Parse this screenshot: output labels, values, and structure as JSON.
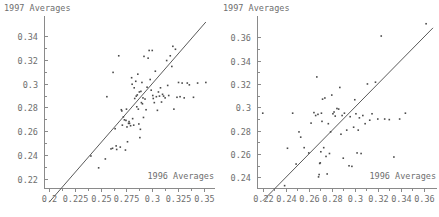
{
  "figure": {
    "panels": [
      {
        "id": "left",
        "ylabel": "1997 Averages",
        "xlabel": "1996 Averages"
      },
      {
        "id": "right",
        "ylabel": "1997 Averages",
        "xlabel": "1996 Averages"
      }
    ]
  },
  "chart_data": [
    {
      "type": "scatter",
      "title": "",
      "xlabel": "1996 Averages",
      "ylabel": "1997 Averages",
      "xlim": [
        0.195,
        0.357
      ],
      "ylim": [
        0.212,
        0.352
      ],
      "xticks": [
        0.2,
        0.225,
        0.25,
        0.275,
        0.3,
        0.325,
        0.35
      ],
      "xticklabels": [
        "0.2",
        "0.225",
        "0.25",
        "0.275",
        "0.3",
        "0.325",
        "0.35"
      ],
      "yticks": [
        0.22,
        0.24,
        0.26,
        0.28,
        0.3,
        0.32,
        0.34
      ],
      "yticklabels": [
        "0.22",
        "0.24",
        "0.26",
        "0.28",
        "0.3",
        "0.32",
        "0.34"
      ],
      "grid": false,
      "legend": null,
      "annotations": [
        {
          "kind": "reference-line",
          "label": "y = x identity line",
          "from": [
            0.2,
            0.2
          ],
          "to": [
            0.352,
            0.352
          ]
        }
      ],
      "x": [
        0.2405,
        0.248,
        0.2545,
        0.256,
        0.26,
        0.2615,
        0.262,
        0.264,
        0.265,
        0.2655,
        0.2675,
        0.269,
        0.27,
        0.2705,
        0.271,
        0.272,
        0.273,
        0.274,
        0.2745,
        0.275,
        0.2755,
        0.276,
        0.277,
        0.2775,
        0.278,
        0.279,
        0.28,
        0.2805,
        0.281,
        0.282,
        0.2825,
        0.283,
        0.284,
        0.2845,
        0.285,
        0.2855,
        0.286,
        0.2865,
        0.287,
        0.2875,
        0.288,
        0.2885,
        0.289,
        0.2895,
        0.29,
        0.2905,
        0.291,
        0.2915,
        0.292,
        0.293,
        0.294,
        0.295,
        0.296,
        0.297,
        0.298,
        0.299,
        0.3,
        0.3005,
        0.301,
        0.302,
        0.303,
        0.304,
        0.305,
        0.306,
        0.307,
        0.308,
        0.309,
        0.31,
        0.311,
        0.3125,
        0.314,
        0.315,
        0.316,
        0.3175,
        0.319,
        0.32,
        0.321,
        0.3225,
        0.324,
        0.3255,
        0.327,
        0.329,
        0.331,
        0.334,
        0.336,
        0.34,
        0.344,
        0.352
      ],
      "y": [
        0.239,
        0.229,
        0.2365,
        0.289,
        0.245,
        0.2455,
        0.3095,
        0.262,
        0.2475,
        0.2445,
        0.3235,
        0.2465,
        0.278,
        0.277,
        0.265,
        0.272,
        0.2695,
        0.244,
        0.269,
        0.2785,
        0.2635,
        0.251,
        0.2665,
        0.268,
        0.2665,
        0.2645,
        0.305,
        0.2995,
        0.2705,
        0.265,
        0.2965,
        0.2875,
        0.302,
        0.2895,
        0.2805,
        0.2905,
        0.308,
        0.2785,
        0.266,
        0.293,
        0.2545,
        0.2615,
        0.2935,
        0.284,
        0.301,
        0.283,
        0.288,
        0.2715,
        0.323,
        0.287,
        0.278,
        0.297,
        0.3215,
        0.328,
        0.3035,
        0.2945,
        0.328,
        0.29,
        0.2875,
        0.284,
        0.3105,
        0.289,
        0.2775,
        0.293,
        0.2895,
        0.2965,
        0.2845,
        0.291,
        0.2895,
        0.288,
        0.3195,
        0.2985,
        0.29,
        0.3235,
        0.3145,
        0.3315,
        0.2785,
        0.329,
        0.2885,
        0.301,
        0.289,
        0.3005,
        0.288,
        0.3005,
        0.299,
        0.2885,
        0.3005,
        0.301
      ]
    },
    {
      "type": "scatter",
      "title": "",
      "xlabel": "1996 Averages",
      "ylabel": "1997 Averages",
      "xlim": [
        0.215,
        0.368
      ],
      "ylim": [
        0.231,
        0.373
      ],
      "xticks": [
        0.22,
        0.24,
        0.26,
        0.28,
        0.3,
        0.32,
        0.34,
        0.36
      ],
      "xticklabels": [
        "0.22",
        "0.24",
        "0.26",
        "0.28",
        "0.3",
        "0.32",
        "0.34",
        "0.36"
      ],
      "yticks": [
        0.24,
        0.26,
        0.28,
        0.3,
        0.32,
        0.34,
        0.36
      ],
      "yticklabels": [
        "0.24",
        "0.26",
        "0.28",
        "0.3",
        "0.32",
        "0.34",
        "0.36"
      ],
      "grid": false,
      "legend": null,
      "annotations": [
        {
          "kind": "reference-line",
          "label": "y = x identity line",
          "from": [
            0.22,
            0.22
          ],
          "to": [
            0.368,
            0.368
          ]
        }
      ],
      "x": [
        0.22,
        0.239,
        0.2415,
        0.246,
        0.249,
        0.2515,
        0.253,
        0.256,
        0.26,
        0.262,
        0.2645,
        0.266,
        0.267,
        0.268,
        0.2685,
        0.269,
        0.2695,
        0.27,
        0.2705,
        0.271,
        0.2715,
        0.272,
        0.273,
        0.274,
        0.275,
        0.276,
        0.277,
        0.278,
        0.279,
        0.28,
        0.281,
        0.282,
        0.283,
        0.2845,
        0.286,
        0.287,
        0.288,
        0.289,
        0.29,
        0.291,
        0.293,
        0.295,
        0.296,
        0.2975,
        0.299,
        0.3,
        0.301,
        0.302,
        0.303,
        0.304,
        0.3055,
        0.307,
        0.309,
        0.311,
        0.313,
        0.315,
        0.318,
        0.32,
        0.323,
        0.326,
        0.33,
        0.334,
        0.339,
        0.344,
        0.362
      ],
      "y": [
        0.295,
        0.233,
        0.265,
        0.295,
        0.2515,
        0.279,
        0.2745,
        0.2655,
        0.261,
        0.2865,
        0.2955,
        0.293,
        0.326,
        0.294,
        0.2405,
        0.2425,
        0.252,
        0.2525,
        0.262,
        0.295,
        0.288,
        0.307,
        0.2655,
        0.308,
        0.258,
        0.243,
        0.286,
        0.2605,
        0.279,
        0.3105,
        0.2945,
        0.296,
        0.2925,
        0.299,
        0.2985,
        0.317,
        0.277,
        0.293,
        0.2565,
        0.295,
        0.2805,
        0.25,
        0.292,
        0.2495,
        0.283,
        0.3065,
        0.2945,
        0.261,
        0.2805,
        0.291,
        0.2605,
        0.293,
        0.286,
        0.32,
        0.289,
        0.2945,
        0.3215,
        0.29,
        0.361,
        0.29,
        0.2895,
        0.2575,
        0.29,
        0.295,
        0.3715
      ]
    }
  ]
}
